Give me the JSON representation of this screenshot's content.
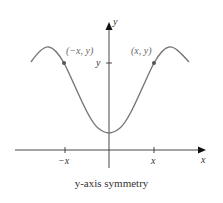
{
  "diagram": {
    "caption": "y-axis symmetry",
    "axes": {
      "x_label": "x",
      "y_label": "y"
    },
    "ticks": {
      "x_neg": "−x",
      "x_pos": "x",
      "y": "y"
    },
    "points": [
      {
        "label": "(−x, y)"
      },
      {
        "label": "(x, y)"
      }
    ],
    "colors": {
      "curve": "#777777",
      "axis": "#333333",
      "text": "#333333"
    }
  }
}
